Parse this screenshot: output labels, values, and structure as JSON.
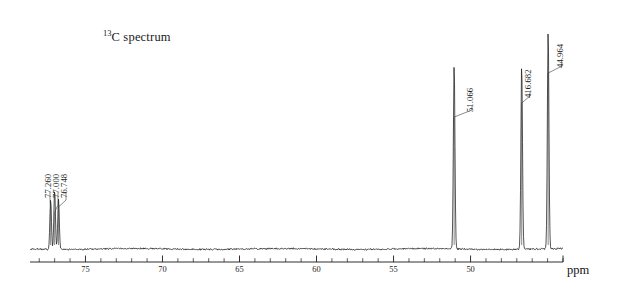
{
  "figure": {
    "title_prefix": "13",
    "title_main": "C spectrum",
    "background_color": "#ffffff",
    "trace_color": "#1a1a1a",
    "axis_color": "#1a1a1a"
  },
  "axis": {
    "unit_label": "ppm",
    "tick_labels": [
      "75",
      "70",
      "65",
      "60",
      "55",
      "50"
    ],
    "tick_values": [
      75,
      70,
      65,
      60,
      55,
      50
    ],
    "minor_tick_step": 1,
    "major_tick_step": 5,
    "range_left_ppm": 78.6,
    "range_right_ppm": 44.0
  },
  "peak_labels": [
    {
      "text": "77.260",
      "ppm": 77.26
    },
    {
      "text": "77.000",
      "ppm": 77.0
    },
    {
      "text": "76.748",
      "ppm": 76.748
    },
    {
      "text": "51.066",
      "ppm": 51.066
    },
    {
      "text": "416.682",
      "ppm": 46.682
    },
    {
      "text": "44.964",
      "ppm": 44.964
    }
  ],
  "chart_data": {
    "type": "line",
    "title": "13C spectrum",
    "xlabel": "ppm",
    "ylabel": "",
    "xlim": [
      78.6,
      44.0
    ],
    "ylim": [
      0,
      1
    ],
    "x_axis_reversed": true,
    "grid": false,
    "legend": null,
    "series": [
      {
        "name": "13C NMR trace",
        "peaks": [
          {
            "ppm": 77.26,
            "relative_height": 0.21,
            "label": "77.260"
          },
          {
            "ppm": 77.0,
            "relative_height": 0.25,
            "label": "77.000"
          },
          {
            "ppm": 76.748,
            "relative_height": 0.21,
            "label": "76.748"
          },
          {
            "ppm": 51.066,
            "relative_height": 0.78,
            "label": "51.066"
          },
          {
            "ppm": 46.682,
            "relative_height": 0.78,
            "label": "416.682"
          },
          {
            "ppm": 44.964,
            "relative_height": 0.92,
            "label": "44.964"
          }
        ]
      }
    ]
  }
}
